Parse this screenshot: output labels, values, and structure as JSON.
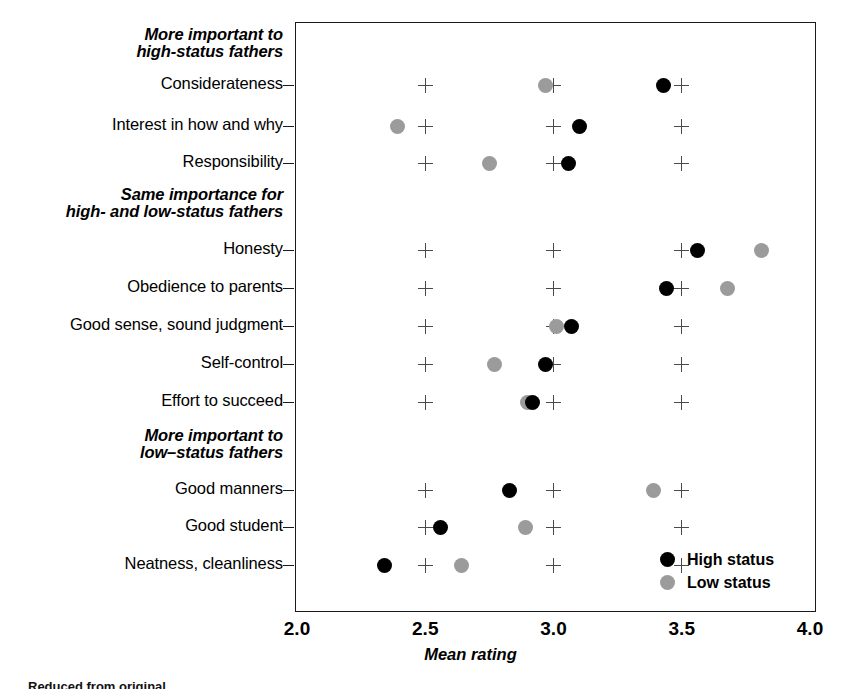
{
  "chart_data": {
    "type": "scatter",
    "title": "",
    "xlabel": "Mean rating",
    "ylabel": "",
    "xlim": [
      2.0,
      4.0
    ],
    "xticks": [
      2.0,
      2.5,
      3.0,
      3.5,
      4.0
    ],
    "xtick_labels": [
      "2.0",
      "2.5",
      "3.0",
      "3.5",
      "4.0"
    ],
    "grid": "plus-markers at 2.5, 3.0, 3.5",
    "legend_position": "bottom-right",
    "series": [
      {
        "name": "High status",
        "color": "#000000",
        "values": [
          3.43,
          3.1,
          3.06,
          3.56,
          3.44,
          3.07,
          2.97,
          2.92,
          2.83,
          2.56,
          2.34
        ]
      },
      {
        "name": "Low status",
        "color": "#9b9b9b",
        "values": [
          2.97,
          2.39,
          2.75,
          3.81,
          3.68,
          3.01,
          2.77,
          2.9,
          3.39,
          2.89,
          2.64
        ]
      }
    ],
    "categories": [
      "Considerateness",
      "Interest in how and why",
      "Responsibility",
      "Honesty",
      "Obedience to parents",
      "Good sense, sound judgment",
      "Self-control",
      "Effort to succeed",
      "Good manners",
      "Good student",
      "Neatness, cleanliness"
    ],
    "group_headings": [
      "More important to\nhigh-status fathers",
      "Same importance for\nhigh- and low-status fathers",
      "More important to\nlow–status fathers"
    ]
  },
  "axis": {
    "x_title": "Mean rating",
    "x_ticks": [
      "2.0",
      "2.5",
      "3.0",
      "3.5",
      "4.0"
    ],
    "grid_plus_positions": [
      "2.5",
      "3.0",
      "3.5"
    ]
  },
  "groups": [
    {
      "heading_line1": "More important to",
      "heading_line2": "high-status fathers"
    },
    {
      "heading_line1": "Same importance for",
      "heading_line2": "high- and low-status fathers"
    },
    {
      "heading_line1": "More important to",
      "heading_line2": "low–status fathers"
    }
  ],
  "rows": [
    {
      "label": "Considerateness",
      "high": "3.43",
      "low": "2.97"
    },
    {
      "label": "Interest in how and why",
      "high": "3.10",
      "low": "2.39"
    },
    {
      "label": "Responsibility",
      "high": "3.06",
      "low": "2.75"
    },
    {
      "label": "Honesty",
      "high": "3.56",
      "low": "3.81"
    },
    {
      "label": "Obedience to parents",
      "high": "3.44",
      "low": "3.68"
    },
    {
      "label": "Good sense, sound judgment",
      "high": "3.07",
      "low": "3.01"
    },
    {
      "label": "Self-control",
      "high": "2.97",
      "low": "2.77"
    },
    {
      "label": "Effort to succeed",
      "high": "2.92",
      "low": "2.90"
    },
    {
      "label": "Good manners",
      "high": "2.83",
      "low": "3.39"
    },
    {
      "label": "Good student",
      "high": "2.56",
      "low": "2.89"
    },
    {
      "label": "Neatness, cleanliness",
      "high": "2.34",
      "low": "2.64"
    }
  ],
  "legend": {
    "items": [
      {
        "label": "High status",
        "color": "#000000",
        "marker": "filled-circle-black"
      },
      {
        "label": "Low status",
        "color": "#9b9b9b",
        "marker": "filled-circle-gray"
      }
    ]
  },
  "caption": {
    "sliver": "Reduced from original"
  }
}
